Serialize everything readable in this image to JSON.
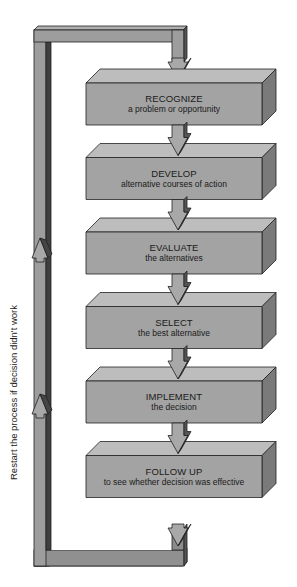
{
  "diagram": {
    "type": "process-flow",
    "steps": [
      {
        "title": "RECOGNIZE",
        "subtitle": "a problem or opportunity"
      },
      {
        "title": "DEVELOP",
        "subtitle": "alternative courses of action"
      },
      {
        "title": "EVALUATE",
        "subtitle": "the alternatives"
      },
      {
        "title": "SELECT",
        "subtitle": "the best alternative"
      },
      {
        "title": "IMPLEMENT",
        "subtitle": "the decision"
      },
      {
        "title": "FOLLOW UP",
        "subtitle": "to see whether decision was effective"
      }
    ],
    "feedback_loop_label": "Restart the process if decision didn't work",
    "colors": {
      "box_front": "#a3a3a3",
      "box_top": "#bdbdbd",
      "box_side": "#7a7a7a",
      "pipe_light": "#9a9a9a",
      "pipe_dark": "#4a4a4a",
      "outline": "#222222"
    }
  }
}
